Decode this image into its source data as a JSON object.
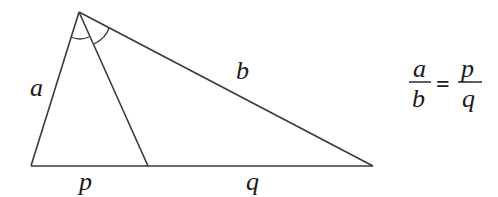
{
  "diagram": {
    "vertices": {
      "apex": "A",
      "bottom_left": "B",
      "bottom_right": "C",
      "bisector_foot": "D"
    },
    "side_labels": {
      "left_side": "a",
      "right_side": "b",
      "base_left_segment": "p",
      "base_right_segment": "q"
    },
    "angle_marks": [
      "equal-angle-arc-left",
      "equal-angle-arc-right"
    ],
    "formula": {
      "lhs_numerator": "a",
      "lhs_denominator": "b",
      "operator": "=",
      "rhs_numerator": "p",
      "rhs_denominator": "q"
    },
    "colors": {
      "stroke": "#3a3a3a",
      "text": "#1a1a1a",
      "background": "#ffffff"
    }
  }
}
